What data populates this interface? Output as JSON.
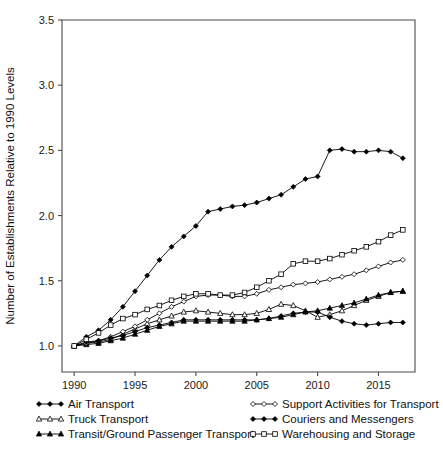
{
  "chart_data": {
    "type": "line",
    "title": "",
    "xlabel": "",
    "ylabel": "Number of Establishments Relative to 1990 Levels",
    "xlim": [
      1989.0,
      2018.0
    ],
    "ylim": [
      0.8,
      3.5
    ],
    "xticks": [
      1990,
      1995,
      2000,
      2005,
      2010,
      2015
    ],
    "yticks": [
      1.0,
      1.5,
      2.0,
      2.5,
      3.0,
      3.5
    ],
    "xtick_labels": [
      "1990",
      "1995",
      "2000",
      "2005",
      "2010",
      "2015"
    ],
    "ytick_labels": [
      "1.0",
      "1.5",
      "2.0",
      "2.5",
      "3.0",
      "3.5"
    ],
    "grid": false,
    "legend_position": "below-axes",
    "x": [
      1990,
      1991,
      1992,
      1993,
      1994,
      1995,
      1996,
      1997,
      1998,
      1999,
      2000,
      2001,
      2002,
      2003,
      2004,
      2005,
      2006,
      2007,
      2008,
      2009,
      2010,
      2011,
      2012,
      2013,
      2014,
      2015,
      2016,
      2017
    ],
    "series": [
      {
        "name": "Air Transport",
        "marker": "filled-diamond",
        "values": [
          1.0,
          1.07,
          1.12,
          1.2,
          1.3,
          1.42,
          1.54,
          1.66,
          1.76,
          1.84,
          1.92,
          2.03,
          2.05,
          2.07,
          2.08,
          2.1,
          2.13,
          2.16,
          2.22,
          2.28,
          2.3,
          2.5,
          2.51,
          2.49,
          2.49,
          2.5,
          2.49,
          2.44
        ]
      },
      {
        "name": "Truck Transport",
        "marker": "open-triangle",
        "values": [
          1.0,
          1.02,
          1.03,
          1.05,
          1.09,
          1.13,
          1.17,
          1.2,
          1.23,
          1.26,
          1.27,
          1.26,
          1.25,
          1.24,
          1.24,
          1.25,
          1.28,
          1.32,
          1.31,
          1.27,
          1.22,
          1.24,
          1.27,
          1.31,
          1.35,
          1.38,
          1.41,
          1.42
        ]
      },
      {
        "name": "Transit/Ground Passenger Transport",
        "marker": "filled-triangle",
        "values": [
          1.0,
          1.01,
          1.02,
          1.04,
          1.06,
          1.09,
          1.12,
          1.15,
          1.17,
          1.19,
          1.19,
          1.19,
          1.19,
          1.19,
          1.19,
          1.2,
          1.21,
          1.22,
          1.24,
          1.26,
          1.27,
          1.29,
          1.31,
          1.33,
          1.36,
          1.39,
          1.41,
          1.42
        ]
      },
      {
        "name": "Support Activities for Transport",
        "marker": "open-diamond",
        "values": [
          1.0,
          1.02,
          1.04,
          1.07,
          1.11,
          1.15,
          1.2,
          1.25,
          1.3,
          1.34,
          1.38,
          1.39,
          1.39,
          1.38,
          1.38,
          1.4,
          1.43,
          1.45,
          1.47,
          1.48,
          1.49,
          1.51,
          1.53,
          1.55,
          1.58,
          1.61,
          1.64,
          1.66
        ]
      },
      {
        "name": "Couriers and Messengers",
        "marker": "filled-diamond",
        "values": [
          1.0,
          1.03,
          1.04,
          1.06,
          1.08,
          1.11,
          1.14,
          1.16,
          1.18,
          1.2,
          1.2,
          1.2,
          1.2,
          1.2,
          1.2,
          1.2,
          1.21,
          1.23,
          1.25,
          1.26,
          1.26,
          1.22,
          1.19,
          1.17,
          1.16,
          1.17,
          1.18,
          1.18
        ]
      },
      {
        "name": "Warehousing and Storage",
        "marker": "open-square",
        "values": [
          1.0,
          1.05,
          1.1,
          1.16,
          1.21,
          1.24,
          1.28,
          1.31,
          1.35,
          1.38,
          1.4,
          1.4,
          1.39,
          1.39,
          1.41,
          1.45,
          1.5,
          1.55,
          1.63,
          1.65,
          1.65,
          1.67,
          1.7,
          1.73,
          1.76,
          1.8,
          1.85,
          1.89
        ]
      }
    ]
  },
  "legend": {
    "entries": [
      {
        "label": "Air Transport",
        "marker": "filled-diamond"
      },
      {
        "label": "Support Activities for Transport",
        "marker": "open-diamond"
      },
      {
        "label": "Truck Transport",
        "marker": "open-triangle"
      },
      {
        "label": "Couriers and Messengers",
        "marker": "filled-diamond"
      },
      {
        "label": "Transit/Ground Passenger Transport",
        "marker": "filled-triangle"
      },
      {
        "label": "Warehousing and Storage",
        "marker": "open-square"
      }
    ]
  },
  "colors": {
    "line": "#000000",
    "axis": "#4a4a4a",
    "background": "#ffffff",
    "text": "#111111"
  }
}
